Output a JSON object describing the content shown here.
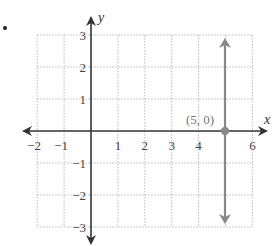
{
  "chart_data": {
    "type": "line",
    "title": "",
    "xlabel": "x",
    "ylabel": "y",
    "xlim": [
      -2,
      6
    ],
    "ylim": [
      -3,
      3
    ],
    "grid": true,
    "grid_style": "dotted",
    "x_ticks": [
      "-2",
      "-1",
      "1",
      "2",
      "3",
      "4",
      "6"
    ],
    "y_ticks": [
      "3",
      "2",
      "1",
      "-1",
      "-2",
      "-3"
    ],
    "series": [
      {
        "name": "x = 5",
        "kind": "vertical-line",
        "x": 5,
        "arrows": "both",
        "color": "#888888"
      }
    ],
    "points": [
      {
        "label": "(5, 0)",
        "x": 5,
        "y": 0,
        "color": "#888888"
      }
    ],
    "annotations": [
      "(5, 0)"
    ]
  },
  "axes": {
    "x_label": "x",
    "y_label": "y"
  },
  "point_label": "(5, 0)",
  "colors": {
    "axis": "#333333",
    "line": "#888888",
    "grid": "#bbbbbb"
  }
}
